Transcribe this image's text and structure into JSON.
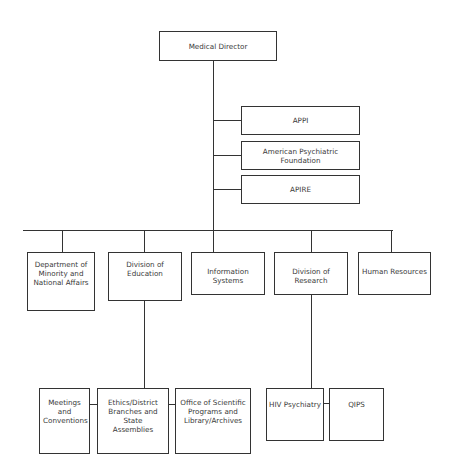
{
  "chart": {
    "type": "org-chart",
    "root": {
      "label": "Medical Director"
    },
    "affiliates": [
      {
        "label": "APPI"
      },
      {
        "label": "American Psychiatric Foundation"
      },
      {
        "label": "APIRE"
      }
    ],
    "departments": [
      {
        "label": "Department of Minority and National Affairs"
      },
      {
        "label": "Division of Education"
      },
      {
        "label": "Information Systems"
      },
      {
        "label": "Division of Research"
      },
      {
        "label": "Human Resources"
      }
    ],
    "education_units": [
      {
        "label": "Meetings and Conventions"
      },
      {
        "label": "Ethics/District Branches and State Assemblies"
      },
      {
        "label": "Office of Scientific Programs and Library/Archives"
      }
    ],
    "research_units": [
      {
        "label": "HIV Psychiatry"
      },
      {
        "label": "QIPS"
      }
    ]
  }
}
